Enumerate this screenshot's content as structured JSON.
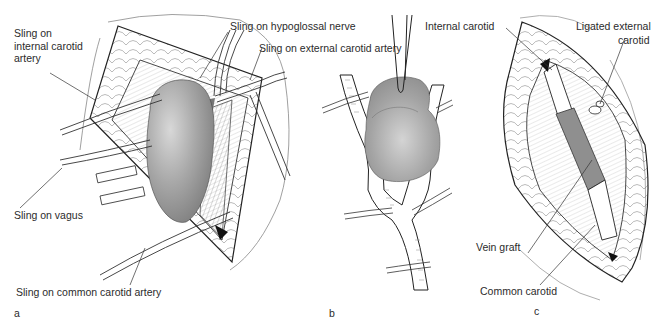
{
  "figure": {
    "panels": [
      {
        "id": "a",
        "letter": "a",
        "labels": {
          "internal_carotid_sling": "Sling on internal carotid artery",
          "hypoglossal_sling": "Sling on hypoglossal nerve",
          "external_carotid_sling": "Sling on external carotid artery",
          "vagus_sling": "Sling on vagus",
          "common_carotid_sling": "Sling on common carotid artery"
        }
      },
      {
        "id": "b",
        "letter": "b"
      },
      {
        "id": "c",
        "letter": "c",
        "labels": {
          "internal_carotid": "Internal carotid",
          "ligated_external_carotid_line1": "Ligated external",
          "ligated_external_carotid_line2": "carotid",
          "vein_graft": "Vein graft",
          "common_carotid": "Common carotid"
        }
      }
    ],
    "colors": {
      "tumor_fill": "#9a9a9a",
      "vein_graft_fill": "#8f8f8f",
      "line": "#2a2a2a",
      "tissue_line": "#555555"
    }
  }
}
